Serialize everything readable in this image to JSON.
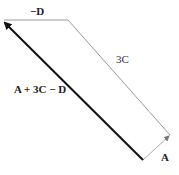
{
  "diagram": {
    "title": "",
    "vectors": [
      {
        "id": "neg-d",
        "label": "−D",
        "from": [
          68,
          20
        ],
        "to": [
          3,
          20
        ],
        "color": "#888888",
        "width": 1
      },
      {
        "id": "three-c",
        "label": "3C",
        "from": [
          68,
          20
        ],
        "to": [
          170,
          135
        ],
        "color": "#888888",
        "width": 1
      },
      {
        "id": "a",
        "label": "A",
        "from": [
          143,
          160
        ],
        "to": [
          170,
          135
        ],
        "color": "#999999",
        "width": 1
      },
      {
        "id": "resultant",
        "label": "A + 3C − D",
        "from": [
          143,
          160
        ],
        "to": [
          3,
          20
        ],
        "color": "#111111",
        "width": 2
      }
    ],
    "labels": {
      "neg_d": "−D",
      "three_c": "3C",
      "a": "A",
      "resultant": "A + 3C − D"
    }
  }
}
